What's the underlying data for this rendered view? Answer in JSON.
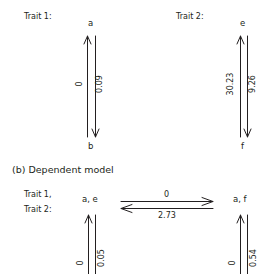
{
  "independent_model": {
    "trait1": {
      "label": "Trait 1:",
      "top_state": "a",
      "bottom_state": "b",
      "rate_up": "0",
      "rate_down": "0.09"
    },
    "trait2": {
      "label": "Trait 2:",
      "top_state": "e",
      "bottom_state": "f",
      "rate_up": "30.23",
      "rate_down": "9.26"
    }
  },
  "dependent_model": {
    "title": "(b) Dependent model",
    "trait_label_line1": "Trait 1,",
    "trait_label_line2": "Trait 2:",
    "states": {
      "left_top": "a, e",
      "right_top": "a, f"
    },
    "rates": {
      "horizontal_forward": "0",
      "horizontal_backward": "2.73",
      "left_vertical_up": "0",
      "left_vertical_down": "0.05",
      "right_vertical_up": "0",
      "right_vertical_down": "0.54"
    }
  },
  "colors": {
    "line": "#231f20",
    "text": "#231f20",
    "background": "#ffffff"
  }
}
